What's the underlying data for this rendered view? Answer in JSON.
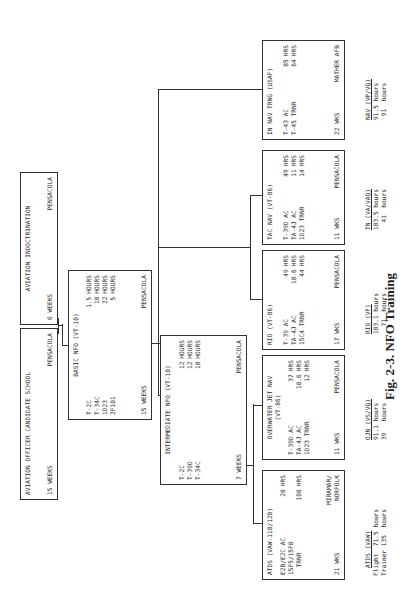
{
  "caption": "Fig. 2-3. NFO Training",
  "boxes": {
    "aocs": {
      "title": "AVIATION OFFICER CANDIDATE SCHOOL",
      "duration": "15 WEEKS",
      "location": "PENSACOLA"
    },
    "indoc": {
      "title": "AVIATION INDOCTRINATION",
      "duration": "6 WEEKS",
      "location": "PENSACOLA"
    },
    "basic": {
      "title": "BASIC NFO (VT-10)",
      "rows": [
        {
          "item": "T-2C",
          "value": "1.5",
          "unit": "HOURS"
        },
        {
          "item": "T-34C",
          "value": "10",
          "unit": "HOURS"
        },
        {
          "item": "1D23",
          "value": "22",
          "unit": "HOURS"
        },
        {
          "item": "2F101",
          "value": "5",
          "unit": "HOURS"
        }
      ],
      "duration": "15 WEEKS",
      "location": "PENSACOLA"
    },
    "intermediate": {
      "title": "INTERMEDIATE NFO (VT-10)",
      "rows": [
        {
          "item": "T-2C",
          "value": "12",
          "unit": "HOURS"
        },
        {
          "item": "T-39D",
          "value": "12",
          "unit": "HOURS"
        },
        {
          "item": "T-34C",
          "value": "10",
          "unit": "HOURS"
        }
      ],
      "duration": "7 WEEKS",
      "location": "PENSACOLA"
    },
    "atds": {
      "title": "ATDS (VAW-110/120)",
      "rows": [
        {
          "item": "E2B/E2C AC",
          "value": "28",
          "unit": "HRS"
        },
        {
          "item": "15F5/15F8",
          "value": "",
          "unit": ""
        },
        {
          "item": "  TRNR",
          "value": "108",
          "unit": "HRS"
        }
      ],
      "duration": "21 WKS",
      "location_line1": "MIRAMAR/",
      "location_line2": "NORFOLK",
      "summary_title": "ATDS (VAW)",
      "summary_rows": [
        "Flight  71.5 hours",
        "Trainer 135  hours"
      ]
    },
    "ojn": {
      "title_line1": "OVERWATER JET NAV",
      "title_line2": "(VT-86)",
      "rows": [
        {
          "item": "T-39D AC",
          "value": "37",
          "unit": "HRS"
        },
        {
          "item": "TA-4J AC",
          "value": "10.6",
          "unit": "HRS"
        },
        {
          "item": "1D23 TRNR",
          "value": "12",
          "unit": "HRS"
        }
      ],
      "duration": "11 WKS",
      "location": "PENSACOLA",
      "summary_title": "OJN (VS/VQ)",
      "summary_rows": [
        "91.1 hours",
        "39   hours"
      ]
    },
    "rio": {
      "title": "RIO (VT-86)",
      "rows": [
        {
          "item": "T-39 AC",
          "value": "49",
          "unit": "HRS"
        },
        {
          "item": "TA-4J AC",
          "value": "10.6",
          "unit": "HRS"
        },
        {
          "item": "15C4 TRNR",
          "value": "44",
          "unit": "HRS"
        }
      ],
      "duration": "17 WKS",
      "location": "PENSACOLA",
      "summary_title": "RIO (VF)",
      "summary_rows": [
        "103.1 hours",
        "  71  hours"
      ]
    },
    "tacnav": {
      "title": "TAC NAV (VT-86)",
      "rows": [
        {
          "item": "T-39D AC",
          "value": "49",
          "unit": "HRS"
        },
        {
          "item": "TA-4J AC",
          "value": "11",
          "unit": "HRS"
        },
        {
          "item": "1D23 TRNR",
          "value": "14",
          "unit": "HRS"
        }
      ],
      "duration": "11 WKS",
      "location": "PENSACOLA",
      "summary_title": "TN (VA/VAQ)",
      "summary_rows": [
        "103.5 hours",
        "  41  hours"
      ]
    },
    "innav": {
      "title": "IN NAV TRNG (USAF)",
      "rows": [
        {
          "item": "T-43 AC",
          "value": "85",
          "unit": "HRS"
        },
        {
          "item": "T-45 TRNR",
          "value": "64",
          "unit": "HRS"
        }
      ],
      "duration": "22 WKS",
      "location": "MATHER AFB",
      "summary_title": "NAV (VP/VQ)",
      "summary_rows": [
        "91.5 hours",
        " 91  hours"
      ]
    }
  }
}
